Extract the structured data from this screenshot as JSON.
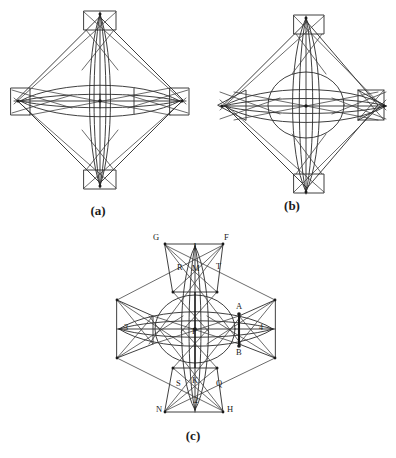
{
  "figure": {
    "background_color": "#ffffff",
    "line_color": "#2a2a2a",
    "bold_line_color": "#1a1a1a",
    "panels": [
      {
        "id": "a",
        "caption": "(a)",
        "description": "Diamond outline with four rectangular boxes at the cardinal points, lenticular arcs at the centre and crossing diagonals",
        "end_shape": "rectangle",
        "labels": []
      },
      {
        "id": "b",
        "caption": "(b)",
        "description": "Diamond outline with triangular wedges left and right, rectangular boxes top and bottom, central circle and lens arcs",
        "end_shape": "wedge",
        "labels": []
      },
      {
        "id": "c",
        "caption": "(c)",
        "description": "Labelled cross construction with vertices marked G F R T A B S Q N H, numbered regions 1 2 3 4 and centre P",
        "end_shape": "mixed",
        "labels": [
          {
            "text": "G",
            "role": "vertex",
            "position": "top-left"
          },
          {
            "text": "F",
            "role": "vertex",
            "position": "top-right"
          },
          {
            "text": "1",
            "role": "region",
            "position": "top"
          },
          {
            "text": "R",
            "role": "vertex",
            "position": "upper-left"
          },
          {
            "text": "M",
            "role": "vertex",
            "position": "upper-centre"
          },
          {
            "text": "T",
            "role": "vertex",
            "position": "upper-right"
          },
          {
            "text": "A",
            "role": "vertex",
            "position": "right-upper"
          },
          {
            "text": "B",
            "role": "vertex",
            "position": "right-lower"
          },
          {
            "text": "4",
            "role": "region",
            "position": "right"
          },
          {
            "text": "3",
            "role": "region",
            "position": "left"
          },
          {
            "text": "P",
            "role": "centre",
            "position": "centre"
          },
          {
            "text": "S",
            "role": "vertex",
            "position": "lower-left"
          },
          {
            "text": "K",
            "role": "vertex",
            "position": "lower-centre"
          },
          {
            "text": "Q",
            "role": "vertex",
            "position": "lower-right"
          },
          {
            "text": "2",
            "role": "region",
            "position": "bottom"
          },
          {
            "text": "N",
            "role": "vertex",
            "position": "bottom-left"
          },
          {
            "text": "H",
            "role": "vertex",
            "position": "bottom-right"
          }
        ]
      }
    ]
  }
}
